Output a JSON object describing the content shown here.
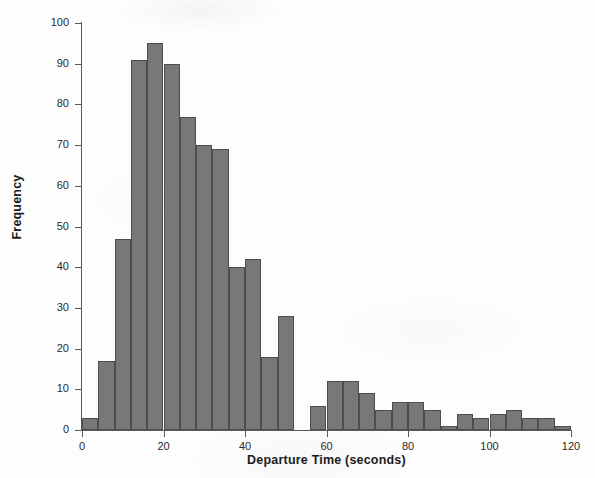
{
  "chart_data": {
    "type": "bar",
    "title": "",
    "subtitle": "",
    "xlabel": "Departure Time (seconds)",
    "ylabel": "Frequency",
    "xlim": [
      0,
      120
    ],
    "ylim": [
      0,
      100
    ],
    "bin_width": 4,
    "grid": false,
    "legend": null,
    "bar_color": "#77787a",
    "bar_edge_color": "#4c4d4f",
    "axis_color": "#5a5a5a",
    "x_ticks": [
      0,
      20,
      40,
      60,
      80,
      100,
      120
    ],
    "x_tick_labels": [
      "0",
      "20",
      "40",
      "60",
      "80",
      "100",
      "120"
    ],
    "y_ticks": [
      0,
      10,
      20,
      30,
      40,
      50,
      60,
      70,
      80,
      90,
      100
    ],
    "y_tick_labels": [
      "0",
      "10",
      "20",
      "30",
      "40",
      "50",
      "60",
      "70",
      "80",
      "90",
      "100"
    ],
    "bins": [
      {
        "x0": 0,
        "x1": 4,
        "value": 3
      },
      {
        "x0": 4,
        "x1": 8,
        "value": 17
      },
      {
        "x0": 8,
        "x1": 12,
        "value": 47
      },
      {
        "x0": 12,
        "x1": 16,
        "value": 91
      },
      {
        "x0": 16,
        "x1": 20,
        "value": 95
      },
      {
        "x0": 20,
        "x1": 24,
        "value": 90
      },
      {
        "x0": 24,
        "x1": 28,
        "value": 77
      },
      {
        "x0": 28,
        "x1": 32,
        "value": 70
      },
      {
        "x0": 32,
        "x1": 36,
        "value": 69
      },
      {
        "x0": 36,
        "x1": 40,
        "value": 40
      },
      {
        "x0": 40,
        "x1": 44,
        "value": 42
      },
      {
        "x0": 44,
        "x1": 48,
        "value": 18
      },
      {
        "x0": 48,
        "x1": 52,
        "value": 28
      },
      {
        "x0": 52,
        "x1": 56,
        "value": 0
      },
      {
        "x0": 56,
        "x1": 60,
        "value": 6
      },
      {
        "x0": 60,
        "x1": 64,
        "value": 12
      },
      {
        "x0": 64,
        "x1": 68,
        "value": 12
      },
      {
        "x0": 68,
        "x1": 72,
        "value": 9
      },
      {
        "x0": 72,
        "x1": 76,
        "value": 5
      },
      {
        "x0": 76,
        "x1": 80,
        "value": 7
      },
      {
        "x0": 80,
        "x1": 84,
        "value": 7
      },
      {
        "x0": 84,
        "x1": 88,
        "value": 5
      },
      {
        "x0": 88,
        "x1": 92,
        "value": 1
      },
      {
        "x0": 92,
        "x1": 96,
        "value": 4
      },
      {
        "x0": 96,
        "x1": 100,
        "value": 3
      },
      {
        "x0": 100,
        "x1": 104,
        "value": 4
      },
      {
        "x0": 104,
        "x1": 108,
        "value": 5
      },
      {
        "x0": 108,
        "x1": 112,
        "value": 3
      },
      {
        "x0": 112,
        "x1": 116,
        "value": 3
      },
      {
        "x0": 116,
        "x1": 120,
        "value": 1
      }
    ]
  }
}
